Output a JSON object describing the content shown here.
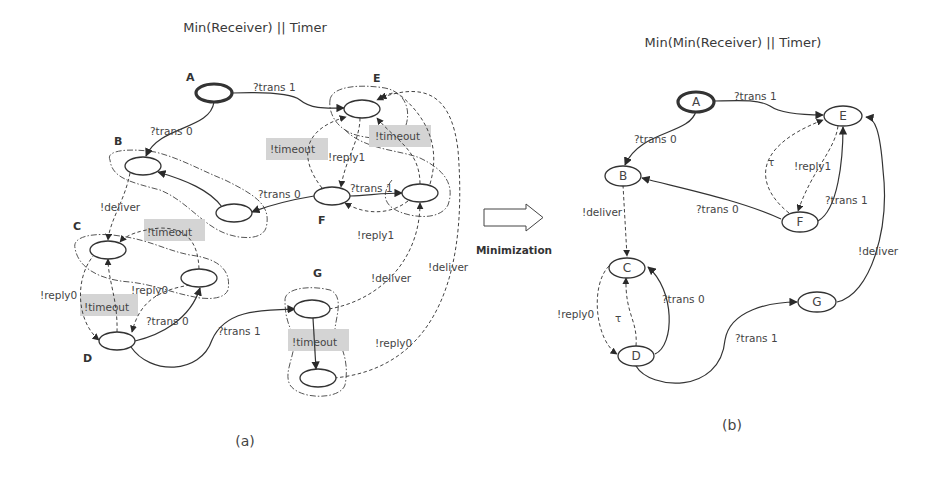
{
  "figure_a": {
    "title": "Min(Receiver) || Timer",
    "caption": "(a)",
    "states": [
      "A",
      "B",
      "C",
      "D",
      "E",
      "F",
      "G"
    ],
    "edge_labels": {
      "a_e": "?trans 1",
      "a_b": "?trans 0",
      "b_c": "!deliver",
      "f_b2": "?trans 0",
      "f_e2": "?trans 1",
      "e_f": "!reply1",
      "e2_f": "!reply1",
      "d_c2": "?trans 0",
      "c2_d": "!reply0",
      "c_d": "!reply0",
      "d_g": "?trans 1",
      "g_e2": "!deliver",
      "g2_e": "!deliver",
      "g2_d": "!reply0"
    },
    "timeout_labels": [
      "!timeout",
      "!timeout",
      "!timeout",
      "!timeout",
      "!timeout"
    ]
  },
  "arrow": {
    "label": "Minimization"
  },
  "figure_b": {
    "title": "Min(Min(Receiver) || Timer)",
    "caption": "(b)",
    "states": [
      "A",
      "B",
      "C",
      "D",
      "E",
      "F",
      "G"
    ],
    "edge_labels": {
      "a_e": "?trans 1",
      "a_b": "?trans 0",
      "b_c": "!deliver",
      "f_b": "?trans 0",
      "f_e": "?trans 1",
      "e_f": "!reply1",
      "f_e_tau": "τ",
      "c_d": "!reply0",
      "d_c_tau": "τ",
      "d_c": "?trans 0",
      "d_g": "?trans 1",
      "g_e": "!deliver"
    }
  }
}
